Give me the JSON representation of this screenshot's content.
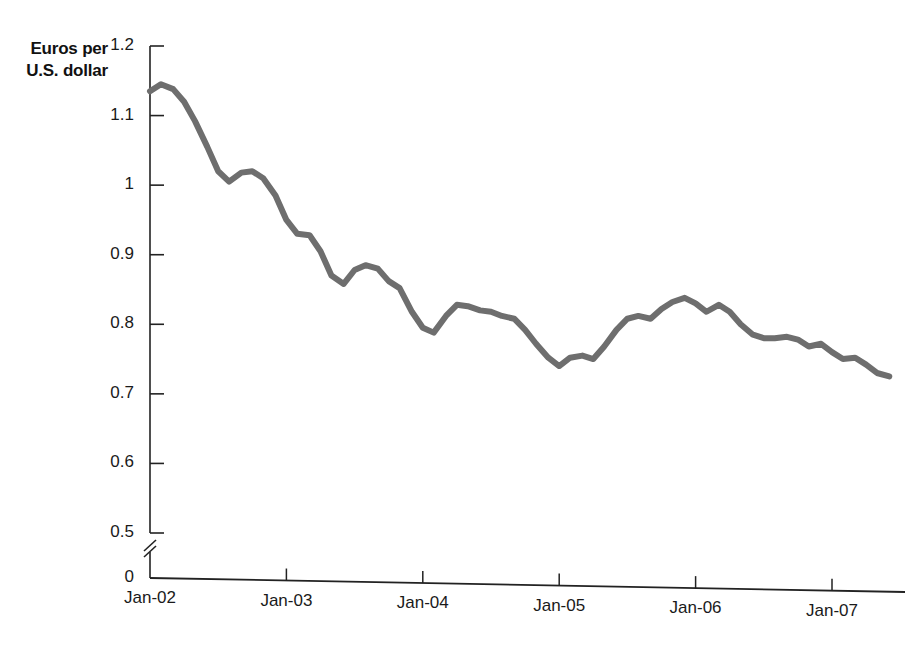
{
  "chart_data": {
    "type": "line",
    "title": "",
    "subtitle": "",
    "ylabel": "Euros per U.S. dollar",
    "xlabel": "",
    "ylim": [
      0,
      1.2
    ],
    "y_axis_break": true,
    "y_break_between": [
      0,
      0.5
    ],
    "grid": false,
    "legend": null,
    "line_color": "#6e6e6e",
    "line_width_px": 6,
    "y_ticks": [
      "1.2",
      "1.1",
      "1",
      "0.9",
      "0.8",
      "0.7",
      "0.6",
      "0.5",
      "0"
    ],
    "y_tick_values": [
      1.2,
      1.1,
      1.0,
      0.9,
      0.8,
      0.7,
      0.6,
      0.5,
      0
    ],
    "x_ticks": [
      "Jan-02",
      "Jan-03",
      "Jan-04",
      "Jan-05",
      "Jan-06",
      "Jan-07"
    ],
    "x_tick_values": [
      2002.0,
      2003.0,
      2004.0,
      2005.0,
      2006.0,
      2007.0
    ],
    "series": [
      {
        "name": "Euros per U.S. dollar",
        "x": [
          2002.0,
          2002.08,
          2002.17,
          2002.25,
          2002.33,
          2002.42,
          2002.5,
          2002.58,
          2002.67,
          2002.75,
          2002.83,
          2002.92,
          2003.0,
          2003.08,
          2003.17,
          2003.25,
          2003.33,
          2003.42,
          2003.5,
          2003.58,
          2003.67,
          2003.75,
          2003.83,
          2003.92,
          2004.0,
          2004.08,
          2004.17,
          2004.25,
          2004.33,
          2004.42,
          2004.5,
          2004.58,
          2004.67,
          2004.75,
          2004.83,
          2004.92,
          2005.0,
          2005.08,
          2005.17,
          2005.25,
          2005.33,
          2005.42,
          2005.5,
          2005.58,
          2005.67,
          2005.75,
          2005.83,
          2005.92,
          2006.0,
          2006.08,
          2006.17,
          2006.25,
          2006.33,
          2006.42,
          2006.5,
          2006.58,
          2006.67,
          2006.75,
          2006.83,
          2006.92,
          2007.0,
          2007.08,
          2007.17,
          2007.25,
          2007.33,
          2007.42
        ],
        "values": [
          1.135,
          1.145,
          1.138,
          1.12,
          1.092,
          1.055,
          1.02,
          1.005,
          1.018,
          1.02,
          1.01,
          0.985,
          0.95,
          0.93,
          0.928,
          0.905,
          0.87,
          0.858,
          0.878,
          0.885,
          0.88,
          0.862,
          0.852,
          0.818,
          0.795,
          0.788,
          0.812,
          0.828,
          0.826,
          0.82,
          0.818,
          0.812,
          0.808,
          0.792,
          0.772,
          0.752,
          0.74,
          0.752,
          0.755,
          0.75,
          0.768,
          0.792,
          0.808,
          0.812,
          0.808,
          0.822,
          0.832,
          0.838,
          0.83,
          0.818,
          0.828,
          0.818,
          0.8,
          0.785,
          0.78,
          0.78,
          0.782,
          0.778,
          0.768,
          0.772,
          0.76,
          0.75,
          0.752,
          0.742,
          0.73,
          0.725
        ]
      }
    ]
  },
  "axis_title": {
    "line1": "Euros per",
    "line2": "U.S. dollar"
  }
}
